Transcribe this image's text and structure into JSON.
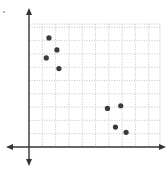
{
  "chart_data": {
    "type": "scatter",
    "title": "",
    "xlabel": "",
    "ylabel": "",
    "grid": true,
    "grid_style": "dotted",
    "xlim": [
      0,
      9.8
    ],
    "ylim": [
      0,
      9.2
    ],
    "axes_arrows": true,
    "legend": null,
    "points": [
      {
        "x": 1.5,
        "y": 8.2
      },
      {
        "x": 2.1,
        "y": 7.3
      },
      {
        "x": 1.3,
        "y": 6.7
      },
      {
        "x": 2.25,
        "y": 5.9
      },
      {
        "x": 5.9,
        "y": 2.9
      },
      {
        "x": 6.9,
        "y": 3.1
      },
      {
        "x": 6.5,
        "y": 1.5
      },
      {
        "x": 7.3,
        "y": 1.1
      }
    ]
  },
  "style": {
    "axis_color": "#333333",
    "grid_color": "#b8b8b8",
    "point_color": "#3a3a3a"
  }
}
